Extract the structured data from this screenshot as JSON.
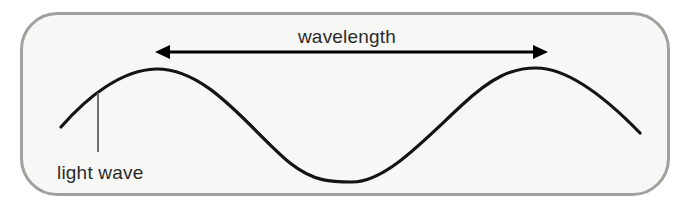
{
  "diagram": {
    "panel": {
      "name": "rounded-panel",
      "fill": "#f7f7f5",
      "border_color": "#a0a09e",
      "border_width": 3,
      "corner_radius": 36,
      "x": 20,
      "y": 12,
      "width": 650,
      "height": 184
    },
    "wave": {
      "name": "sine-wave",
      "stroke": "#141414",
      "stroke_width": 3.2,
      "start": {
        "x": 61,
        "y": 127
      },
      "peak1": {
        "x": 156,
        "y": 69
      },
      "trough": {
        "x": 352,
        "y": 182
      },
      "peak2": {
        "x": 536,
        "y": 68
      },
      "end": {
        "x": 640,
        "y": 133
      },
      "path": "M 61 127 C 88 96, 122 70, 156 69 C 208 68, 250 130, 290 163 C 314 182, 332 182, 352 182 C 386 182, 424 140, 462 105 C 492 77, 512 68, 536 68 C 570 68, 608 100, 640 133"
    },
    "arrow": {
      "name": "wavelength-arrow",
      "stroke": "#000000",
      "stroke_width": 3,
      "y": 52,
      "x_left": 155,
      "x_right": 548,
      "head_length": 15,
      "head_half_width": 7
    },
    "leader_line": {
      "name": "light-wave-leader-line",
      "stroke": "#6f6f6f",
      "stroke_width": 2,
      "x": 98,
      "y_top": 93,
      "y_bottom": 152
    },
    "labels": {
      "wavelength": {
        "text": "wavelength",
        "x": 347,
        "y": 43,
        "anchor": "middle",
        "font_size": 19
      },
      "light_wave": {
        "text": "light wave",
        "x": 57,
        "y": 179,
        "anchor": "start",
        "font_size": 19
      }
    },
    "colors": {
      "page_background": "#ffffff",
      "panel_background": "#f7f7f5",
      "panel_border": "#a0a09e",
      "ink": "#141414",
      "text": "#2b2b2b",
      "leader": "#6f6f6f"
    }
  }
}
